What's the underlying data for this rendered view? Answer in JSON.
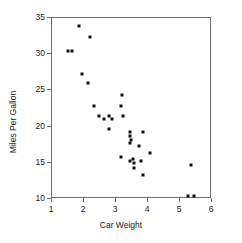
{
  "chart_data": {
    "type": "scatter",
    "title": "",
    "xlabel": "Car Weight",
    "ylabel": "Miles Per Gallon",
    "xlim": [
      1,
      6
    ],
    "ylim": [
      10,
      35
    ],
    "xticks": [
      1,
      2,
      3,
      4,
      5,
      6
    ],
    "yticks": [
      10,
      15,
      20,
      25,
      30,
      35
    ],
    "grid": false,
    "legend": null,
    "marker": {
      "shape": "square",
      "color": "#111111",
      "size_px": 3
    },
    "axis_color": "#6e6e6e",
    "series": [
      {
        "name": "cars",
        "x": [
          2.62,
          2.875,
          2.32,
          3.215,
          3.44,
          3.46,
          3.57,
          3.19,
          3.15,
          3.44,
          3.44,
          4.07,
          3.73,
          3.78,
          5.25,
          5.424,
          5.345,
          2.2,
          1.615,
          1.835,
          2.465,
          3.52,
          3.435,
          3.84,
          3.845,
          1.935,
          2.14,
          1.513,
          3.17,
          2.77,
          3.57,
          2.78
        ],
        "y": [
          21.0,
          21.0,
          22.8,
          21.4,
          18.7,
          18.1,
          14.3,
          24.4,
          22.8,
          19.2,
          17.8,
          16.4,
          17.3,
          15.2,
          10.4,
          10.4,
          14.7,
          32.4,
          30.4,
          33.9,
          21.5,
          15.5,
          15.2,
          13.3,
          19.2,
          27.3,
          26.0,
          30.4,
          15.8,
          19.7,
          15.0,
          21.4
        ]
      }
    ]
  }
}
